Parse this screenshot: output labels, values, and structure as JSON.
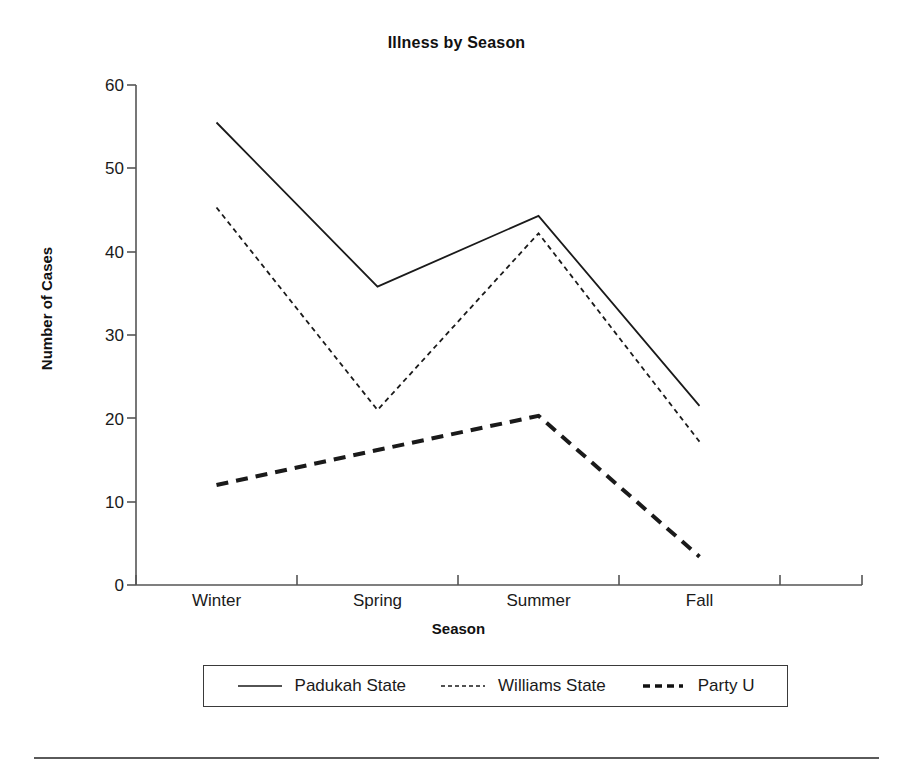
{
  "chart_data": {
    "type": "line",
    "title": "Illness by Season",
    "xlabel": "Season",
    "ylabel": "Number of Cases",
    "categories": [
      "Winter",
      "Spring",
      "Summer",
      "Fall"
    ],
    "ylim": [
      0,
      60
    ],
    "yticks": [
      0,
      10,
      20,
      30,
      40,
      50,
      60
    ],
    "grid": false,
    "legend_position": "bottom",
    "series": [
      {
        "name": "Padukah State",
        "style": "solid",
        "values": [
          55.5,
          35.8,
          44.3,
          21.5
        ]
      },
      {
        "name": "Williams State",
        "style": "dotted",
        "values": [
          45.3,
          21.0,
          42.2,
          17.2
        ]
      },
      {
        "name": "Party U",
        "style": "dashed-thick",
        "values": [
          12.0,
          16.2,
          20.3,
          3.4
        ]
      }
    ]
  },
  "axis": {
    "y_tick_labels": [
      "60",
      "50",
      "40",
      "30",
      "20",
      "10",
      "0"
    ],
    "x_tick_labels": [
      "Winter",
      "Spring",
      "Summer",
      "Fall"
    ]
  },
  "legend": {
    "entries": [
      {
        "label": "Padukah State",
        "swatch": "solid-line-swatch"
      },
      {
        "label": "Williams State",
        "swatch": "dotted-line-swatch"
      },
      {
        "label": "Party U",
        "swatch": "dashed-line-swatch"
      }
    ]
  },
  "colors": {
    "line": "#1a1a1a",
    "axis": "#555555",
    "background": "#ffffff"
  }
}
